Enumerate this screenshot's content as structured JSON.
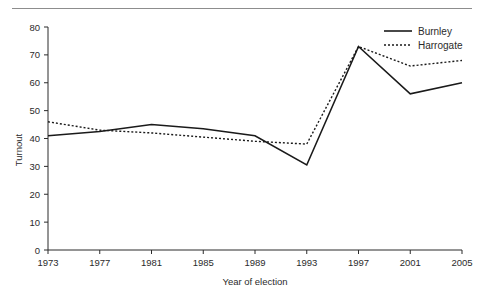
{
  "chart_data": {
    "type": "line",
    "title": "",
    "xlabel": "Year of election",
    "ylabel": "Turnout",
    "categories": [
      1973,
      1977,
      1981,
      1985,
      1989,
      1993,
      1997,
      2001,
      2005
    ],
    "xtick_labels": [
      "1973",
      "1977",
      "1981",
      "1985",
      "1989",
      "1993",
      "1997",
      "2001",
      "2005"
    ],
    "ytick_labels": [
      "0",
      "10",
      "20",
      "30",
      "40",
      "50",
      "60",
      "70",
      "80"
    ],
    "yticks": [
      0,
      10,
      20,
      30,
      40,
      50,
      60,
      70,
      80
    ],
    "ylim": [
      0,
      80
    ],
    "xlim": [
      1973,
      2005
    ],
    "grid": false,
    "legend_position": "top-right",
    "series": [
      {
        "name": "Burnley",
        "style": "solid",
        "color": "#1a1a1a",
        "values": [
          41,
          42.5,
          45,
          43.5,
          41,
          30.5,
          73,
          56,
          60
        ]
      },
      {
        "name": "Harrogate",
        "style": "dotted",
        "color": "#1a1a1a",
        "values": [
          46,
          43,
          42,
          40.5,
          39,
          38,
          73,
          66,
          68
        ]
      }
    ]
  },
  "legend": {
    "items": [
      {
        "label": "Burnley",
        "style": "solid"
      },
      {
        "label": "Harrogate",
        "style": "dotted"
      }
    ]
  },
  "axes": {
    "y_title": "Turnout",
    "x_title": "Year of election"
  }
}
